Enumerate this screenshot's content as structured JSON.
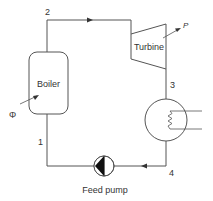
{
  "diagram": {
    "type": "rankine-cycle-schematic",
    "components": {
      "boiler": {
        "label": "Boiler"
      },
      "turbine": {
        "label": "Turbine"
      },
      "condenser": {
        "label": ""
      },
      "pump": {
        "label": "Feed pump"
      }
    },
    "states": {
      "s1": "1",
      "s2": "2",
      "s3": "3",
      "s4": "4"
    },
    "inputs": {
      "heat": "Φ",
      "power": "P"
    },
    "colors": {
      "line": "#555555",
      "text": "#333333",
      "pump_fill": "#111111"
    }
  }
}
